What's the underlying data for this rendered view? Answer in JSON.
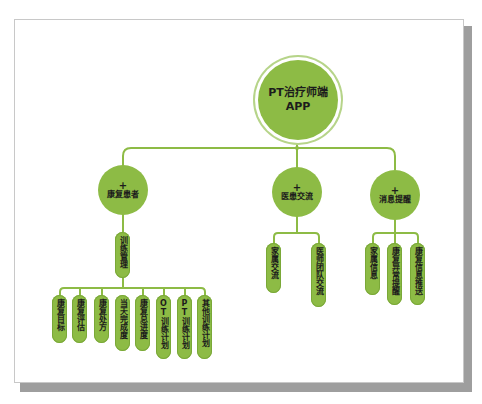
{
  "diagram": {
    "root": {
      "line1": "PT治疗师端",
      "line2": "APP"
    },
    "categories": [
      {
        "plus": "+",
        "label": "康复患者"
      },
      {
        "plus": "+",
        "label": "医患交流"
      },
      {
        "plus": "+",
        "label": "消息提醒"
      }
    ],
    "subcategory": {
      "label": "训练管理"
    },
    "patient_leaves": [
      "康复目标",
      "康复评估",
      "康复处方",
      "当天完成度",
      "康复总进度",
      "OT训练计划",
      "PT训练计划",
      "其他训练计划"
    ],
    "communication_leaves": [
      "家属交流",
      "医师团队交流"
    ],
    "notification_leaves": [
      "家属信息",
      "康复异常提醒",
      "康复信息推送"
    ]
  },
  "colors": {
    "node_fill": "#8dbb45",
    "connector": "#8dbb45",
    "root_ring": "#b6d489",
    "text": "#1c1c1c",
    "frame_shadow": "#9e9e9e"
  }
}
